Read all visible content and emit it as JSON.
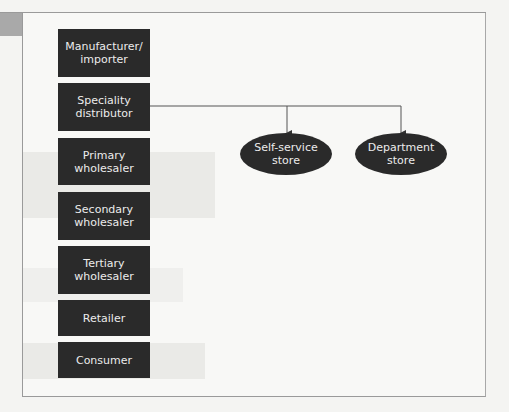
{
  "diagram": {
    "chain_boxes": [
      {
        "label": "Manufacturer/\nimporter"
      },
      {
        "label": "Speciality\ndistributor"
      },
      {
        "label": "Primary\nwholesaler"
      },
      {
        "label": "Secondary\nwholesaler"
      },
      {
        "label": "Tertiary\nwholesaler"
      },
      {
        "label": "Retailer"
      },
      {
        "label": "Consumer"
      }
    ],
    "targets": [
      {
        "label": "Self-service\nstore"
      },
      {
        "label": "Department\nstore"
      }
    ],
    "connections": [
      {
        "from": "Speciality distributor",
        "to": "Self-service store"
      },
      {
        "from": "Speciality distributor",
        "to": "Department store"
      }
    ],
    "colors": {
      "node_fill": "#2a2a2a",
      "node_text": "#ececec",
      "line": "#555555"
    }
  }
}
